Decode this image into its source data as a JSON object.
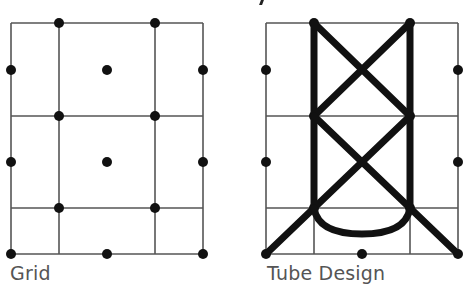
{
  "figures": [
    {
      "id": "grid",
      "label": "Grid",
      "grid": {
        "x": [
          11,
          59,
          155,
          203
        ],
        "y": [
          23,
          116,
          208,
          254
        ]
      },
      "dots": [
        [
          59,
          23
        ],
        [
          155,
          23
        ],
        [
          11,
          70
        ],
        [
          107,
          70
        ],
        [
          203,
          70
        ],
        [
          59,
          116
        ],
        [
          155,
          116
        ],
        [
          11,
          162
        ],
        [
          107,
          162
        ],
        [
          203,
          162
        ],
        [
          59,
          208
        ],
        [
          155,
          208
        ],
        [
          11,
          254
        ],
        [
          107,
          254
        ],
        [
          203,
          254
        ]
      ]
    },
    {
      "id": "tube-design",
      "label": "Tube Design",
      "grid": {
        "x": [
          266,
          314,
          410,
          458
        ],
        "y": [
          23,
          116,
          208,
          254
        ]
      },
      "dots": [
        [
          314,
          23
        ],
        [
          410,
          23
        ],
        [
          266,
          70
        ],
        [
          458,
          70
        ],
        [
          314,
          116
        ],
        [
          410,
          116
        ],
        [
          266,
          162
        ],
        [
          458,
          162
        ],
        [
          314,
          208
        ],
        [
          410,
          208
        ],
        [
          266,
          254
        ],
        [
          362,
          254
        ],
        [
          458,
          254
        ]
      ]
    }
  ],
  "colors": {
    "line": "#555555",
    "dot": "#111111",
    "tube": "#111111",
    "text": "#555555"
  }
}
